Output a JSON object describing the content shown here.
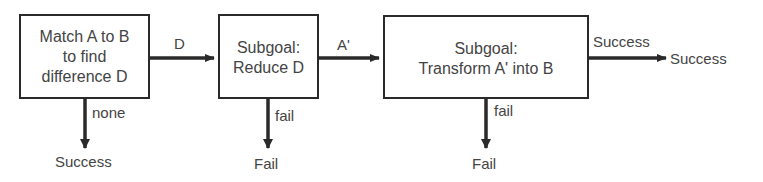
{
  "diagram": {
    "nodes": [
      {
        "id": "match",
        "lines": [
          "Match A to B",
          "to find",
          "difference D"
        ]
      },
      {
        "id": "reduce",
        "lines": [
          "Subgoal:",
          "Reduce D"
        ]
      },
      {
        "id": "transform",
        "lines": [
          "Subgoal:",
          "Transform A' into B"
        ]
      }
    ],
    "edges": [
      {
        "from": "match",
        "to": "reduce",
        "label": "D"
      },
      {
        "from": "reduce",
        "to": "transform",
        "label": "A'"
      },
      {
        "from": "transform",
        "to": "success_right",
        "label": "Success"
      },
      {
        "from": "match",
        "to": "success_bottom",
        "label": "none"
      },
      {
        "from": "reduce",
        "to": "fail_1",
        "label": "fail"
      },
      {
        "from": "transform",
        "to": "fail_2",
        "label": "fail"
      }
    ],
    "terminals": {
      "success_bottom": "Success",
      "fail_1": "Fail",
      "fail_2": "Fail",
      "success_right": "Success"
    }
  }
}
